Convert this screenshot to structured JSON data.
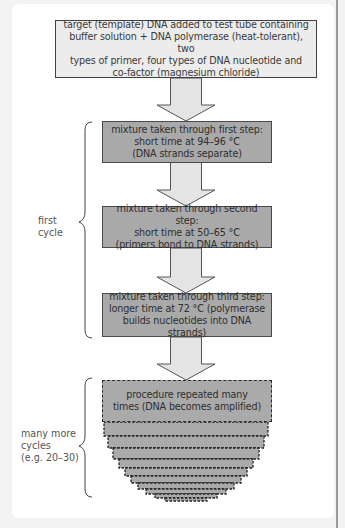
{
  "diagram": {
    "start_box": "target (template) DNA added to test tube containing\nbuffer solution + DNA polymerase (heat-tolerant), two\ntypes of primer, four types of DNA nucleotide and\nco-factor (magnesium chloride)",
    "steps": [
      {
        "text": "mixture taken through first step:\nshort time at 94–96 °C\n(DNA strands separate)"
      },
      {
        "text": "mixture taken through second step:\nshort time at 50–65 °C\n(primers bond to DNA strands)"
      },
      {
        "text": "mixture taken through third step:\nlonger time at 72 °C (polymerase\nbuilds nucleotides into DNA strands)"
      }
    ],
    "repeat_box": "procedure repeated many\ntimes (DNA becomes amplified)",
    "brace_labels": {
      "first_cycle": "first\ncycle",
      "more_cycles": "many more\ncycles\n(e.g. 20–30)"
    },
    "colors": {
      "start_fill": "#ececec",
      "step_fill": "#a9a9a9",
      "arrow_fill": "#e4e4e4",
      "outline": "#404040"
    }
  }
}
